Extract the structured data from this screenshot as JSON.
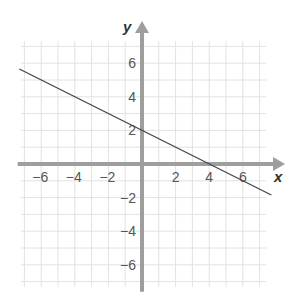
{
  "chart_data": {
    "type": "line",
    "title": "",
    "xlabel": "x",
    "ylabel": "y",
    "xlim": [
      -7,
      7
    ],
    "ylim": [
      -7,
      7
    ],
    "grid": true,
    "x_ticks": [
      "−6",
      "−4",
      "−2",
      "2",
      "4",
      "6"
    ],
    "y_ticks": [
      "6",
      "4",
      "2",
      "−2",
      "−4",
      "−6"
    ],
    "x_tick_values": [
      -6,
      -4,
      -2,
      2,
      4,
      6
    ],
    "y_tick_values": [
      6,
      4,
      2,
      -2,
      -4,
      -6
    ],
    "series": [
      {
        "name": "line",
        "equation": "y = -0.5x + 2",
        "slope": -0.5,
        "y_intercept": 2,
        "x_intercept": 4,
        "x": [
          -7.3,
          7.7
        ],
        "y": [
          5.65,
          -1.85
        ]
      }
    ],
    "colors": {
      "axis": "#9e9e9e",
      "grid": "#e2e2e2",
      "line": "#444444"
    }
  }
}
